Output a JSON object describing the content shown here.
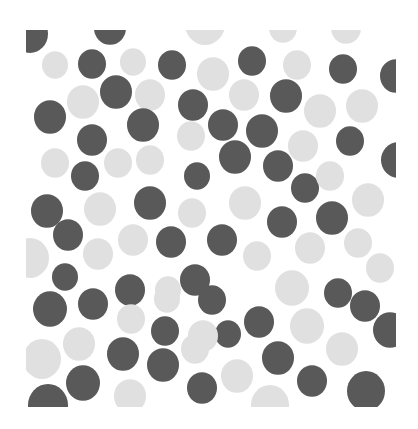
{
  "image": {
    "description": "Pattern of irregular dark gray and light gray circular blobs on white, clipped to a square",
    "width": 418,
    "height": 429,
    "clip": {
      "x": 26,
      "y": 30,
      "width": 370,
      "height": 377
    },
    "colors": {
      "background": "#ffffff",
      "dark": "#595959",
      "light": "#e0e0e0"
    },
    "circles": [
      {
        "t": "d",
        "x": 30,
        "y": 34,
        "r": 18
      },
      {
        "t": "d",
        "x": 110,
        "y": 28,
        "r": 16
      },
      {
        "t": "l",
        "x": 205,
        "y": 24,
        "r": 20
      },
      {
        "t": "l",
        "x": 283,
        "y": 28,
        "r": 14
      },
      {
        "t": "l",
        "x": 346,
        "y": 28,
        "r": 15
      },
      {
        "t": "l",
        "x": 55,
        "y": 65,
        "r": 13
      },
      {
        "t": "d",
        "x": 92,
        "y": 64,
        "r": 14
      },
      {
        "t": "l",
        "x": 133,
        "y": 62,
        "r": 13
      },
      {
        "t": "d",
        "x": 172,
        "y": 65,
        "r": 14
      },
      {
        "t": "l",
        "x": 213,
        "y": 74,
        "r": 16
      },
      {
        "t": "d",
        "x": 252,
        "y": 61,
        "r": 14
      },
      {
        "t": "l",
        "x": 297,
        "y": 65,
        "r": 14
      },
      {
        "t": "d",
        "x": 343,
        "y": 69,
        "r": 14
      },
      {
        "t": "d",
        "x": 396,
        "y": 76,
        "r": 16
      },
      {
        "t": "l",
        "x": 83,
        "y": 102,
        "r": 16
      },
      {
        "t": "d",
        "x": 116,
        "y": 92,
        "r": 16
      },
      {
        "t": "l",
        "x": 150,
        "y": 95,
        "r": 15
      },
      {
        "t": "d",
        "x": 193,
        "y": 105,
        "r": 15
      },
      {
        "t": "l",
        "x": 244,
        "y": 95,
        "r": 15
      },
      {
        "t": "d",
        "x": 286,
        "y": 96,
        "r": 16
      },
      {
        "t": "d",
        "x": 50,
        "y": 117,
        "r": 16
      },
      {
        "t": "d",
        "x": 143,
        "y": 125,
        "r": 16
      },
      {
        "t": "d",
        "x": 223,
        "y": 125,
        "r": 15
      },
      {
        "t": "d",
        "x": 262,
        "y": 131,
        "r": 16
      },
      {
        "t": "l",
        "x": 320,
        "y": 111,
        "r": 16
      },
      {
        "t": "l",
        "x": 362,
        "y": 106,
        "r": 16
      },
      {
        "t": "d",
        "x": 92,
        "y": 140,
        "r": 15
      },
      {
        "t": "l",
        "x": 191,
        "y": 136,
        "r": 14
      },
      {
        "t": "l",
        "x": 303,
        "y": 146,
        "r": 15
      },
      {
        "t": "d",
        "x": 350,
        "y": 141,
        "r": 14
      },
      {
        "t": "d",
        "x": 398,
        "y": 160,
        "r": 17
      },
      {
        "t": "l",
        "x": 55,
        "y": 163,
        "r": 14
      },
      {
        "t": "l",
        "x": 118,
        "y": 163,
        "r": 14
      },
      {
        "t": "l",
        "x": 150,
        "y": 160,
        "r": 14
      },
      {
        "t": "d",
        "x": 235,
        "y": 157,
        "r": 16
      },
      {
        "t": "d",
        "x": 278,
        "y": 166,
        "r": 15
      },
      {
        "t": "d",
        "x": 85,
        "y": 176,
        "r": 14
      },
      {
        "t": "d",
        "x": 197,
        "y": 176,
        "r": 13
      },
      {
        "t": "d",
        "x": 305,
        "y": 188,
        "r": 14
      },
      {
        "t": "l",
        "x": 330,
        "y": 176,
        "r": 14
      },
      {
        "t": "d",
        "x": 47,
        "y": 211,
        "r": 16
      },
      {
        "t": "l",
        "x": 100,
        "y": 209,
        "r": 16
      },
      {
        "t": "d",
        "x": 150,
        "y": 203,
        "r": 16
      },
      {
        "t": "l",
        "x": 192,
        "y": 213,
        "r": 14
      },
      {
        "t": "l",
        "x": 245,
        "y": 203,
        "r": 16
      },
      {
        "t": "l",
        "x": 368,
        "y": 200,
        "r": 16
      },
      {
        "t": "d",
        "x": 68,
        "y": 235,
        "r": 15
      },
      {
        "t": "l",
        "x": 133,
        "y": 240,
        "r": 15
      },
      {
        "t": "d",
        "x": 171,
        "y": 242,
        "r": 15
      },
      {
        "t": "d",
        "x": 222,
        "y": 240,
        "r": 15
      },
      {
        "t": "d",
        "x": 282,
        "y": 222,
        "r": 15
      },
      {
        "t": "d",
        "x": 332,
        "y": 218,
        "r": 16
      },
      {
        "t": "l",
        "x": 30,
        "y": 258,
        "r": 19
      },
      {
        "t": "l",
        "x": 98,
        "y": 254,
        "r": 15
      },
      {
        "t": "l",
        "x": 257,
        "y": 256,
        "r": 14
      },
      {
        "t": "l",
        "x": 310,
        "y": 248,
        "r": 15
      },
      {
        "t": "l",
        "x": 358,
        "y": 243,
        "r": 14
      },
      {
        "t": "d",
        "x": 65,
        "y": 277,
        "r": 13
      },
      {
        "t": "d",
        "x": 130,
        "y": 290,
        "r": 15
      },
      {
        "t": "l",
        "x": 168,
        "y": 290,
        "r": 13
      },
      {
        "t": "d",
        "x": 195,
        "y": 280,
        "r": 15
      },
      {
        "t": "l",
        "x": 292,
        "y": 288,
        "r": 17
      },
      {
        "t": "l",
        "x": 380,
        "y": 268,
        "r": 14
      },
      {
        "t": "d",
        "x": 50,
        "y": 309,
        "r": 17
      },
      {
        "t": "d",
        "x": 93,
        "y": 304,
        "r": 15
      },
      {
        "t": "l",
        "x": 167,
        "y": 299,
        "r": 13
      },
      {
        "t": "d",
        "x": 212,
        "y": 300,
        "r": 14
      },
      {
        "t": "d",
        "x": 338,
        "y": 293,
        "r": 14
      },
      {
        "t": "d",
        "x": 365,
        "y": 306,
        "r": 15
      },
      {
        "t": "l",
        "x": 131,
        "y": 319,
        "r": 14
      },
      {
        "t": "d",
        "x": 165,
        "y": 331,
        "r": 14
      },
      {
        "t": "d",
        "x": 228,
        "y": 334,
        "r": 13
      },
      {
        "t": "d",
        "x": 259,
        "y": 322,
        "r": 15
      },
      {
        "t": "l",
        "x": 307,
        "y": 326,
        "r": 17
      },
      {
        "t": "d",
        "x": 390,
        "y": 330,
        "r": 17
      },
      {
        "t": "l",
        "x": 203,
        "y": 336,
        "r": 15
      },
      {
        "t": "l",
        "x": 79,
        "y": 344,
        "r": 16
      },
      {
        "t": "l",
        "x": 342,
        "y": 349,
        "r": 16
      },
      {
        "t": "l",
        "x": 42,
        "y": 359,
        "r": 19
      },
      {
        "t": "d",
        "x": 123,
        "y": 354,
        "r": 16
      },
      {
        "t": "d",
        "x": 163,
        "y": 365,
        "r": 16
      },
      {
        "t": "l",
        "x": 195,
        "y": 349,
        "r": 14
      },
      {
        "t": "d",
        "x": 278,
        "y": 358,
        "r": 16
      },
      {
        "t": "d",
        "x": 83,
        "y": 383,
        "r": 17
      },
      {
        "t": "l",
        "x": 130,
        "y": 396,
        "r": 16
      },
      {
        "t": "d",
        "x": 202,
        "y": 388,
        "r": 15
      },
      {
        "t": "l",
        "x": 237,
        "y": 376,
        "r": 16
      },
      {
        "t": "d",
        "x": 312,
        "y": 381,
        "r": 15
      },
      {
        "t": "d",
        "x": 366,
        "y": 391,
        "r": 19
      },
      {
        "t": "d",
        "x": 48,
        "y": 405,
        "r": 20
      },
      {
        "t": "l",
        "x": 270,
        "y": 405,
        "r": 19
      }
    ]
  }
}
